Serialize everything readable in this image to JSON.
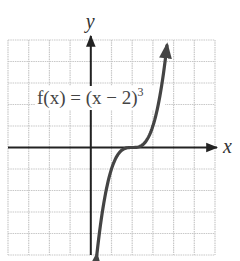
{
  "chart_data": {
    "type": "line",
    "title": "",
    "function": "f(x) = (x - 2)^3",
    "annotation": {
      "prefix": "f(x) = (x − 2)",
      "exponent": "3"
    },
    "xlabel": "x",
    "ylabel": "y",
    "xlim": [
      -4,
      6
    ],
    "ylim": [
      -5,
      5
    ],
    "grid": true,
    "grid_step": 1,
    "legend": null,
    "series": [
      {
        "name": "f(x) = (x - 2)^3",
        "x": [
          0.29,
          0.5,
          1.0,
          1.5,
          2.0,
          2.5,
          3.0,
          3.5,
          3.68
        ],
        "y": [
          -5.0,
          -3.375,
          -1.0,
          -0.125,
          0.0,
          0.125,
          1.0,
          3.375,
          4.74
        ],
        "arrows": "both ends"
      }
    ],
    "colors": {
      "grid": "#c8c8c8",
      "axis": "#222222",
      "curve": "#444444"
    }
  }
}
